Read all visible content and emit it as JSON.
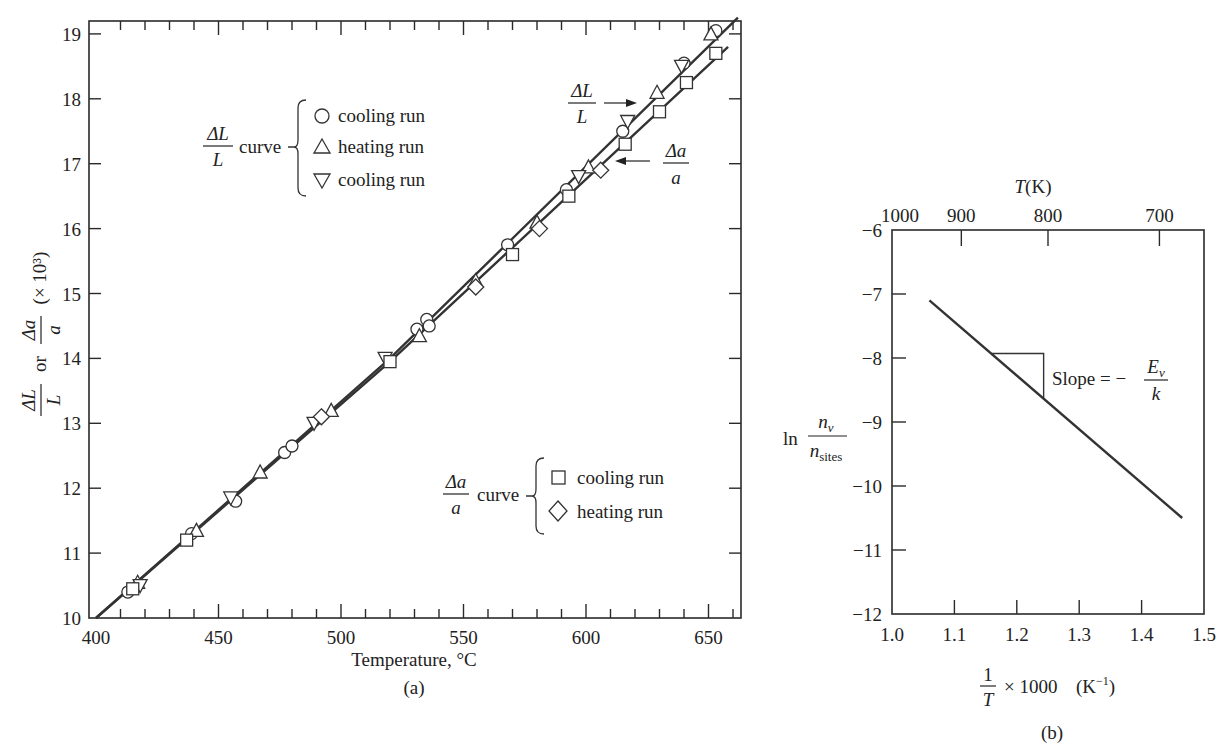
{
  "chart_data": [
    {
      "id": "a",
      "type": "scatter",
      "caption": "(a)",
      "xlabel": "Temperature, °C",
      "ylabel": "ΔL/L or Δa/a (× 10³)",
      "xlim": [
        400,
        663
      ],
      "ylim": [
        10,
        19.2
      ],
      "xticks": [
        400,
        450,
        500,
        550,
        600,
        650
      ],
      "xminor_step": 10,
      "yticks": [
        10,
        11,
        12,
        13,
        14,
        15,
        16,
        17,
        18,
        19
      ],
      "grid": false,
      "lines": [
        {
          "name": "ΔL/L",
          "x": [
            400,
            520,
            662
          ],
          "y": [
            10.0,
            14.0,
            19.25
          ]
        },
        {
          "name": "Δa/a",
          "x": [
            400,
            520,
            658
          ],
          "y": [
            10.0,
            13.95,
            18.8
          ]
        }
      ],
      "annotations": [
        {
          "text": "ΔL/L",
          "arrow_to": "ΔL/L line",
          "pos": [
            607,
            18.1
          ]
        },
        {
          "text": "Δa/a",
          "arrow_to": "Δa/a line",
          "pos": [
            640,
            17.0
          ]
        }
      ],
      "legend_groups": [
        {
          "label": "ΔL/L curve",
          "entries": [
            {
              "marker": "circle",
              "label": "cooling run"
            },
            {
              "marker": "triangle-up",
              "label": "heating run"
            },
            {
              "marker": "triangle-down",
              "label": "cooling run"
            }
          ]
        },
        {
          "label": "Δa/a curve",
          "entries": [
            {
              "marker": "square",
              "label": "cooling run"
            },
            {
              "marker": "diamond",
              "label": "heating run"
            }
          ]
        }
      ],
      "series": [
        {
          "name": "ΔL/L cooling run (circle)",
          "marker": "circle",
          "x": [
            413,
            439,
            457,
            477,
            480,
            531,
            535,
            536,
            568,
            592,
            615,
            640,
            653
          ],
          "y": [
            10.4,
            11.3,
            11.8,
            12.55,
            12.65,
            14.45,
            14.6,
            14.5,
            15.75,
            16.6,
            17.5,
            18.55,
            19.05
          ]
        },
        {
          "name": "ΔL/L heating run (triangle-up)",
          "marker": "triangle-up",
          "x": [
            417,
            441,
            467,
            496,
            532,
            555,
            580,
            601,
            629,
            651
          ],
          "y": [
            10.55,
            11.35,
            12.25,
            13.2,
            14.35,
            15.2,
            16.1,
            16.95,
            18.1,
            19.0
          ]
        },
        {
          "name": "ΔL/L cooling run (triangle-down)",
          "marker": "triangle-down",
          "x": [
            418,
            455,
            489,
            518,
            597,
            617,
            639
          ],
          "y": [
            10.5,
            11.85,
            13.0,
            14.0,
            16.8,
            17.65,
            18.5
          ]
        },
        {
          "name": "Δa/a cooling run (square)",
          "marker": "square",
          "x": [
            415,
            437,
            520,
            570,
            593,
            616,
            630,
            641,
            653
          ],
          "y": [
            10.45,
            11.2,
            13.95,
            15.6,
            16.5,
            17.3,
            17.8,
            18.25,
            18.7
          ]
        },
        {
          "name": "Δa/a heating run (diamond)",
          "marker": "diamond",
          "x": [
            492,
            555,
            581,
            606
          ],
          "y": [
            13.1,
            15.1,
            16.0,
            16.9
          ]
        }
      ]
    },
    {
      "id": "b",
      "type": "line",
      "caption": "(b)",
      "xlabel": "1/T × 1000 (K⁻¹)",
      "ylabel": "ln n_v / n_sites",
      "top_axis_label": "T(K)",
      "xlim": [
        1.0,
        1.5
      ],
      "ylim": [
        -12,
        -6
      ],
      "xticks": [
        1.0,
        1.1,
        1.2,
        1.3,
        1.4,
        1.5
      ],
      "yticks": [
        -6,
        -7,
        -8,
        -9,
        -10,
        -11,
        -12
      ],
      "top_ticks": [
        1000,
        900,
        800,
        700
      ],
      "grid": false,
      "series": [
        {
          "name": "ln(n_v/n_sites)",
          "x": [
            1.06,
            1.465
          ],
          "y": [
            -7.1,
            -10.5
          ]
        }
      ],
      "annotations": [
        {
          "text": "Slope = −E_v / k",
          "triangle": {
            "x": [
              1.16,
              1.243
            ],
            "y": [
              -7.93,
              -8.62
            ]
          }
        }
      ]
    }
  ],
  "labels": {
    "a": {
      "caption": "(a)",
      "xlabel": "Temperature, °C",
      "y_dl": "ΔL",
      "y_l": "L",
      "y_or": "or",
      "y_da": "Δa",
      "y_a": "a",
      "y_scale": "(× 10³)",
      "legend1_num": "ΔL",
      "legend1_den": "L",
      "legend1_word": "curve",
      "legend1_e1": "cooling run",
      "legend1_e2": "heating run",
      "legend1_e3": "cooling run",
      "legend2_num": "Δa",
      "legend2_den": "a",
      "legend2_word": "curve",
      "legend2_e1": "cooling run",
      "legend2_e2": "heating run",
      "ann1_num": "ΔL",
      "ann1_den": "L",
      "ann2_num": "Δa",
      "ann2_den": "a"
    },
    "b": {
      "caption": "(b)",
      "top_T": "T",
      "top_K": "(K)",
      "y_ln": "ln",
      "y_num": "n",
      "y_num_sub": "v",
      "y_den": "n",
      "y_den_sub": "sites",
      "x_one": "1",
      "x_T": "T",
      "x_rest": "× 1000",
      "x_unit": "(K",
      "x_exp": "−1",
      "x_close": ")",
      "slope": "Slope = −",
      "slope_num": "E",
      "slope_num_sub": "v",
      "slope_den": "k"
    }
  }
}
